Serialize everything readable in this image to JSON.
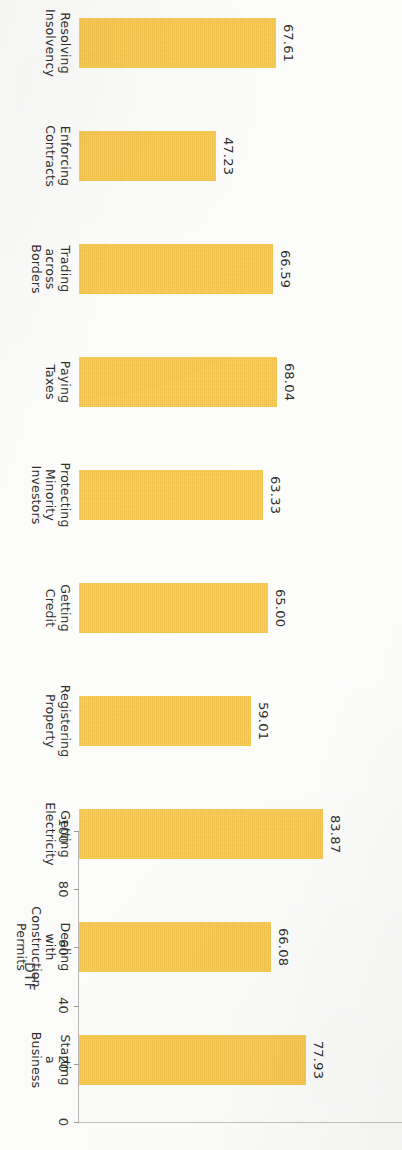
{
  "chart_data": {
    "type": "bar",
    "title": "",
    "subtitle": "",
    "orientation": "vertical-rotated-90",
    "xlabel": "",
    "ylabel": "DTF",
    "ylim": [
      0,
      100
    ],
    "y_ticks": [
      "0",
      "20",
      "40",
      "60",
      "80",
      "100"
    ],
    "y_tick_values": [
      0,
      20,
      40,
      60,
      80,
      100
    ],
    "grid": false,
    "legend": false,
    "bar_color": "#f7c64a",
    "axis_color": "#b9b9b7",
    "text_color": "#2e2e2c",
    "categories": [
      "Starting a Business",
      "Dealing with Construction Permits",
      "Getting Electricity",
      "Registering Property",
      "Getting Credit",
      "Protecting Minority Investors",
      "Paying Taxes",
      "Trading across Borders",
      "Enforcing Contracts",
      "Resolving Insolvency"
    ],
    "category_lines": [
      [
        "Starting",
        "a",
        "Business"
      ],
      [
        "Dealing",
        "with",
        "Construction",
        "Permits"
      ],
      [
        "Getting",
        "Electricity"
      ],
      [
        "Registering",
        "Property"
      ],
      [
        "Getting",
        "Credit"
      ],
      [
        "Protecting",
        "Minority",
        "Investors"
      ],
      [
        "Paying",
        "Taxes"
      ],
      [
        "Trading",
        "across",
        "Borders"
      ],
      [
        "Enforcing",
        "Contracts"
      ],
      [
        "Resolving",
        "Insolvency"
      ]
    ],
    "values": [
      77.93,
      66.08,
      83.87,
      59.01,
      65.0,
      63.33,
      68.04,
      66.59,
      47.23,
      67.61
    ],
    "value_labels": [
      "77.93",
      "66.08",
      "83.87",
      "59.01",
      "65.00",
      "63.33",
      "68.04",
      "66.59",
      "47.23",
      "67.61"
    ]
  }
}
